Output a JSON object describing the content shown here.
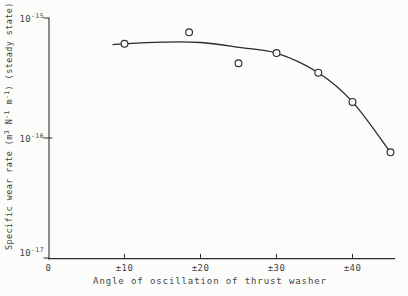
{
  "figure": {
    "background": "#fcfcfb",
    "ink_color": "#2f2f2f"
  },
  "chart_data": {
    "type": "scatter",
    "title": "",
    "xlabel": "Angle of oscillation of thrust washer",
    "ylabel": "Specific wear rate (m³ N⁻¹ m⁻¹) (steady state)",
    "ylabel_parts": [
      "Specific wear rate (m",
      "3",
      " N",
      "-1",
      " m",
      "-1",
      ") (steady state)"
    ],
    "legend": "none",
    "grid": false,
    "x_axis": {
      "scale": "linear",
      "unit": "± degrees",
      "range": [
        0,
        45.5
      ],
      "ticks": [
        {
          "angle": 0,
          "label": "0"
        },
        {
          "angle": 10,
          "label": "±10"
        },
        {
          "angle": 20,
          "label": "±20"
        },
        {
          "angle": 30,
          "label": "±30"
        },
        {
          "angle": 40,
          "label": "±40"
        }
      ]
    },
    "y_axis": {
      "scale": "log",
      "range": [
        1e-17,
        1e-15
      ],
      "ticks": [
        {
          "value": 1e-15,
          "base": "10",
          "exp": "-15"
        },
        {
          "value": 1e-16,
          "base": "10",
          "exp": "-16"
        },
        {
          "value": 1e-17,
          "base": "10",
          "exp": "-17"
        }
      ]
    },
    "series": [
      {
        "name": "measured points",
        "marker": "open-circle",
        "points": [
          {
            "x": 10,
            "y": 6.1e-16
          },
          {
            "x": 18.5,
            "y": 7.6e-16
          },
          {
            "x": 25,
            "y": 4.2e-16
          },
          {
            "x": 30,
            "y": 5.1e-16
          },
          {
            "x": 35.5,
            "y": 3.5e-16
          },
          {
            "x": 40,
            "y": 2e-16
          },
          {
            "x": 45,
            "y": 7.6e-17
          }
        ]
      },
      {
        "name": "fitted curve",
        "marker": "none",
        "points": [
          {
            "x": 8.5,
            "y": 6e-16
          },
          {
            "x": 10,
            "y": 6.1e-16
          },
          {
            "x": 15,
            "y": 6.3e-16
          },
          {
            "x": 20,
            "y": 6.25e-16
          },
          {
            "x": 25,
            "y": 5.7e-16
          },
          {
            "x": 30,
            "y": 5.1e-16
          },
          {
            "x": 35.5,
            "y": 3.5e-16
          },
          {
            "x": 40,
            "y": 2e-16
          },
          {
            "x": 45,
            "y": 7.6e-17
          }
        ]
      }
    ]
  }
}
